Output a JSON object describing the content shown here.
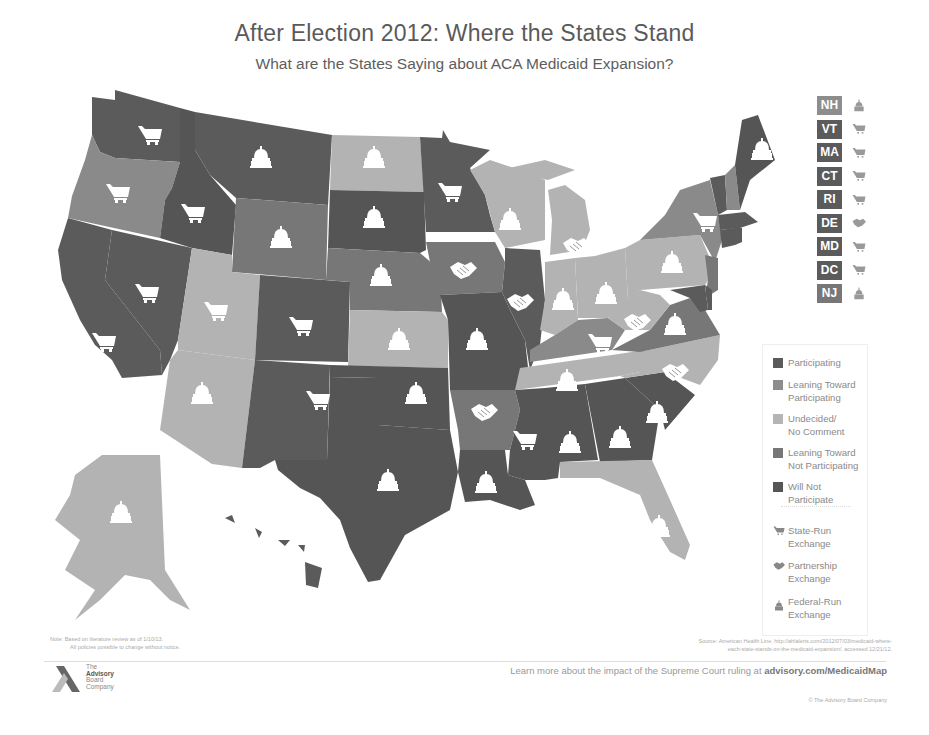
{
  "header": {
    "title": "After Election 2012: Where the States Stand",
    "subtitle": "What are the States Saying about ACA Medicaid Expansion?"
  },
  "colors": {
    "participating": "#5b5b5b",
    "leaning_participating": "#8a8a8a",
    "undecided": "#b3b3b3",
    "leaning_not": "#757575",
    "will_not": "#555555",
    "icon_fill": "#ffffff",
    "background": "#ffffff"
  },
  "legend": {
    "status": [
      {
        "key": "participating",
        "label_1": "Participating",
        "label_2": "",
        "color": "#5b5b5b"
      },
      {
        "key": "leaning_participating",
        "label_1": "Leaning Toward",
        "label_2": "Participating",
        "color": "#8d8d8d"
      },
      {
        "key": "undecided",
        "label_1": "Undecided/",
        "label_2": "No Comment",
        "color": "#b5b5b5"
      },
      {
        "key": "leaning_not",
        "label_1": "Leaning Toward",
        "label_2": "Not Participating",
        "color": "#777777"
      },
      {
        "key": "will_not",
        "label_1": "Will Not",
        "label_2": "Participate",
        "color": "#555555"
      }
    ],
    "exchange": [
      {
        "key": "state",
        "icon": "cart-icon",
        "label_1": "State-Run",
        "label_2": "Exchange"
      },
      {
        "key": "partnership",
        "icon": "handshake-icon",
        "label_1": "Partnership",
        "label_2": "Exchange"
      },
      {
        "key": "federal",
        "icon": "capitol-icon",
        "label_1": "Federal-Run",
        "label_2": "Exchange"
      }
    ]
  },
  "small_states": [
    {
      "code": "NH",
      "status": "leaning_participating",
      "exchange": "federal"
    },
    {
      "code": "VT",
      "status": "participating",
      "exchange": "state"
    },
    {
      "code": "MA",
      "status": "participating",
      "exchange": "state"
    },
    {
      "code": "CT",
      "status": "participating",
      "exchange": "state"
    },
    {
      "code": "RI",
      "status": "participating",
      "exchange": "state"
    },
    {
      "code": "DE",
      "status": "participating",
      "exchange": "partnership"
    },
    {
      "code": "MD",
      "status": "participating",
      "exchange": "state"
    },
    {
      "code": "DC",
      "status": "participating",
      "exchange": "state"
    },
    {
      "code": "NJ",
      "status": "leaning_not",
      "exchange": "federal"
    }
  ],
  "states": {
    "WA": {
      "status": "participating",
      "exchange": "state"
    },
    "OR": {
      "status": "leaning_participating",
      "exchange": "state"
    },
    "CA": {
      "status": "participating",
      "exchange": "state"
    },
    "NV": {
      "status": "participating",
      "exchange": "state"
    },
    "ID": {
      "status": "will_not",
      "exchange": "state"
    },
    "MT": {
      "status": "participating",
      "exchange": "federal"
    },
    "WY": {
      "status": "leaning_not",
      "exchange": "federal"
    },
    "UT": {
      "status": "undecided",
      "exchange": "state"
    },
    "AZ": {
      "status": "undecided",
      "exchange": "federal"
    },
    "CO": {
      "status": "participating",
      "exchange": "state"
    },
    "NM": {
      "status": "participating",
      "exchange": "state"
    },
    "ND": {
      "status": "undecided",
      "exchange": "federal"
    },
    "SD": {
      "status": "will_not",
      "exchange": "federal"
    },
    "NE": {
      "status": "leaning_not",
      "exchange": "federal"
    },
    "KS": {
      "status": "undecided",
      "exchange": "federal"
    },
    "OK": {
      "status": "will_not",
      "exchange": "federal"
    },
    "TX": {
      "status": "will_not",
      "exchange": "federal"
    },
    "MN": {
      "status": "participating",
      "exchange": "state"
    },
    "IA": {
      "status": "leaning_not",
      "exchange": "partnership"
    },
    "MO": {
      "status": "will_not",
      "exchange": "federal"
    },
    "AR": {
      "status": "leaning_not",
      "exchange": "partnership"
    },
    "LA": {
      "status": "will_not",
      "exchange": "federal"
    },
    "WI": {
      "status": "undecided",
      "exchange": "federal"
    },
    "IL": {
      "status": "participating",
      "exchange": "partnership"
    },
    "MI": {
      "status": "undecided",
      "exchange": "partnership"
    },
    "IN": {
      "status": "undecided",
      "exchange": "federal"
    },
    "OH": {
      "status": "undecided",
      "exchange": "federal"
    },
    "KY": {
      "status": "leaning_participating",
      "exchange": "state"
    },
    "TN": {
      "status": "undecided",
      "exchange": "federal"
    },
    "MS": {
      "status": "will_not",
      "exchange": "state"
    },
    "AL": {
      "status": "will_not",
      "exchange": "federal"
    },
    "GA": {
      "status": "will_not",
      "exchange": "federal"
    },
    "FL": {
      "status": "undecided",
      "exchange": "federal"
    },
    "SC": {
      "status": "will_not",
      "exchange": "federal"
    },
    "NC": {
      "status": "undecided",
      "exchange": "partnership"
    },
    "VA": {
      "status": "leaning_not",
      "exchange": "federal"
    },
    "WV": {
      "status": "undecided",
      "exchange": "partnership"
    },
    "PA": {
      "status": "undecided",
      "exchange": "federal"
    },
    "NY": {
      "status": "leaning_participating",
      "exchange": "state"
    },
    "ME": {
      "status": "will_not",
      "exchange": "federal"
    },
    "AK": {
      "status": "undecided",
      "exchange": "federal"
    },
    "HI": {
      "status": "participating",
      "exchange": "state"
    }
  },
  "footer": {
    "note_1": "Note: Based on literature review as of 1/10/13.",
    "note_2": "All policies possible to change without notice.",
    "source_1": "Source: American Health Line, http://ahlalerts.com/2012/07/03/medicaid-where-",
    "source_2": "each-state-stands-on-the-medicaid-expansion/, accessed 12/21/12.",
    "learn_prefix": "Learn more about the impact of the Supreme Court ruling at ",
    "learn_link": "advisory.com/MedicaidMap",
    "copyright": "© The Advisory Board Company",
    "logo_line_1": "The",
    "logo_line_2": "Advisory",
    "logo_line_3": "Board",
    "logo_line_4": "Company"
  }
}
